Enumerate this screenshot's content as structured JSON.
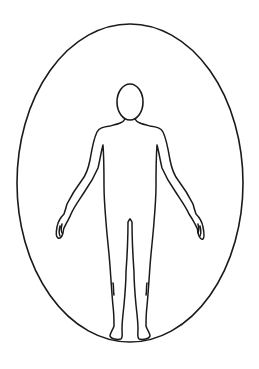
{
  "figure": {
    "description": "Outline of a standing human figure (front view, arms slightly out) enclosed within a vertical ellipse",
    "colors": {
      "background": "#ffffff",
      "line": "#1a1a1a"
    },
    "ellipse": {
      "cx": 130,
      "cy": 183,
      "rx": 113,
      "ry": 159,
      "stroke_width": 1.6
    },
    "head": {
      "cx": 130,
      "cy": 102,
      "rx": 13,
      "ry": 18,
      "stroke_width": 1.6
    },
    "body_stroke_width": 1.5
  }
}
